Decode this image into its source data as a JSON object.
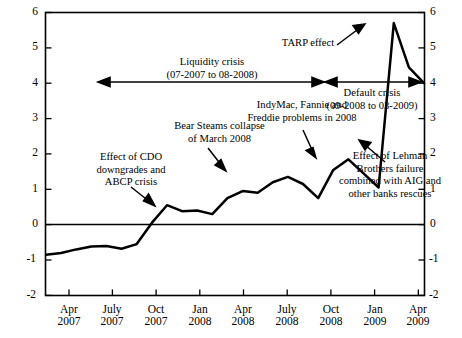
{
  "chart_data": {
    "type": "line",
    "title": "",
    "xlabel": "",
    "ylabel": "",
    "ylim": [
      -2,
      6
    ],
    "grid": false,
    "legend": "none",
    "y_ticks": [
      "6",
      "5",
      "4",
      "3",
      "2",
      "1",
      "0",
      "-1",
      "-2"
    ],
    "y_ticks_right": [
      "6",
      "5",
      "4",
      "3",
      "2",
      "1",
      "0",
      "-1",
      "-2"
    ],
    "x_ticks": [
      {
        "month": "Apr",
        "year": "2007"
      },
      {
        "month": "July",
        "year": "2007"
      },
      {
        "month": "Oct",
        "year": "2007"
      },
      {
        "month": "Jan",
        "year": "2008"
      },
      {
        "month": "Apr",
        "year": "2008"
      },
      {
        "month": "July",
        "year": "2008"
      },
      {
        "month": "Oct",
        "year": "2008"
      },
      {
        "month": "Jan",
        "year": "2009"
      },
      {
        "month": "Apr",
        "year": "2009"
      }
    ],
    "zero_line": 0,
    "x": [
      "2007-03",
      "2007-04",
      "2007-05",
      "2007-06",
      "2007-07",
      "2007-08",
      "2007-09",
      "2007-10",
      "2007-11",
      "2007-12",
      "2008-01",
      "2008-02",
      "2008-03",
      "2008-04",
      "2008-05",
      "2008-06",
      "2008-07",
      "2008-08",
      "2008-09",
      "2008-10",
      "2008-11",
      "2008-12",
      "2009-01",
      "2009-02",
      "2009-03",
      "2009-04"
    ],
    "values": [
      -0.85,
      -0.8,
      -0.7,
      -0.62,
      -0.6,
      -0.68,
      -0.55,
      0.05,
      0.55,
      0.38,
      0.4,
      0.3,
      0.75,
      0.95,
      0.9,
      1.2,
      1.35,
      1.15,
      0.75,
      1.55,
      1.85,
      1.45,
      1.05,
      5.7,
      4.45,
      4.0
    ],
    "series_name": "Spread"
  },
  "annotations": [
    {
      "id": "liquidity-crisis",
      "lines": [
        "Liquidity crisis",
        "(07-2007 to 08-2008)"
      ],
      "type": "double-arrow-span"
    },
    {
      "id": "default-crisis",
      "lines": [
        "Default crisis",
        "(09-2008 to 03-2009)"
      ],
      "type": "double-arrow-span"
    },
    {
      "id": "tarp-effect",
      "lines": [
        "TARP effect"
      ],
      "type": "arrow-callout"
    },
    {
      "id": "cdo-abcp",
      "lines": [
        "Effect of CDO",
        "downgrades and",
        "ABCP crisis"
      ],
      "type": "arrow-callout"
    },
    {
      "id": "bear-stearns",
      "lines": [
        "Bear Steams collapse",
        "of March 2008"
      ],
      "type": "arrow-callout"
    },
    {
      "id": "indymac-fannie-freddie",
      "lines": [
        "IndyMac, Fannie and",
        "Freddie problems in 2008"
      ],
      "type": "arrow-callout"
    },
    {
      "id": "lehman-aig",
      "lines": [
        "Effect of Lehman",
        "Brothers failure",
        "combined with AIG and",
        "other banks rescues"
      ],
      "type": "arrow-callout"
    }
  ],
  "colors": {
    "line": "#000000",
    "axis": "#000000",
    "background": "#ffffff",
    "text": "#000000"
  }
}
